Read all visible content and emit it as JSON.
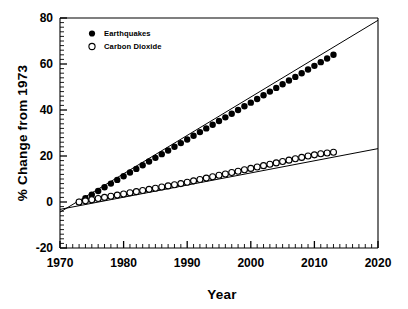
{
  "chart_data": {
    "type": "scatter",
    "title": "",
    "subtitle": "",
    "xlabel": "Year",
    "ylabel": "% Change from 1973",
    "xlim": [
      1970,
      2020
    ],
    "ylim": [
      -20,
      80
    ],
    "xticks": [
      1970,
      1980,
      1990,
      2000,
      2010,
      2020
    ],
    "xtick_labels": [
      "1970",
      "1980",
      "1990",
      "2000",
      "2010",
      "2020"
    ],
    "yticks": [
      -20,
      0,
      20,
      40,
      60,
      80
    ],
    "ytick_labels": [
      "-20",
      "0",
      "20",
      "40",
      "60",
      "80"
    ],
    "x_minor_tick_interval": 1,
    "y_minor_tick_interval": 2,
    "grid": false,
    "legend_position": "top-left",
    "legend": [
      {
        "name": "Earthquakes",
        "marker": "filled-circle",
        "color": "#000000"
      },
      {
        "name": "Carbon Dioxide",
        "marker": "open-circle",
        "color": "#000000"
      }
    ],
    "series": [
      {
        "name": "Earthquakes",
        "marker": "filled-circle",
        "color": "#000000",
        "x": [
          1973,
          1974,
          1975,
          1976,
          1977,
          1978,
          1979,
          1980,
          1981,
          1982,
          1983,
          1984,
          1985,
          1986,
          1987,
          1988,
          1989,
          1990,
          1991,
          1992,
          1993,
          1994,
          1995,
          1996,
          1997,
          1998,
          1999,
          2000,
          2001,
          2002,
          2003,
          2004,
          2005,
          2006,
          2007,
          2008,
          2009,
          2010,
          2011,
          2012,
          2013
        ],
        "y": [
          0.0,
          1.6,
          3.2,
          4.8,
          6.4,
          8.0,
          9.6,
          11.2,
          12.8,
          14.4,
          16.0,
          17.6,
          19.2,
          20.8,
          22.4,
          24.0,
          25.6,
          27.2,
          28.8,
          30.4,
          32.0,
          33.6,
          35.2,
          36.8,
          38.4,
          40.0,
          41.6,
          43.2,
          44.8,
          46.4,
          48.0,
          49.6,
          51.2,
          52.8,
          54.4,
          56.0,
          57.6,
          59.2,
          60.8,
          62.4,
          64.0
        ],
        "trendline": {
          "x": [
            1970,
            2020
          ],
          "y": [
            -4.4,
            79.0
          ]
        }
      },
      {
        "name": "Carbon Dioxide",
        "marker": "open-circle",
        "color": "#000000",
        "x": [
          1973,
          1974,
          1975,
          1976,
          1977,
          1978,
          1979,
          1980,
          1981,
          1982,
          1983,
          1984,
          1985,
          1986,
          1987,
          1988,
          1989,
          1990,
          1991,
          1992,
          1993,
          1994,
          1995,
          1996,
          1997,
          1998,
          1999,
          2000,
          2001,
          2002,
          2003,
          2004,
          2005,
          2006,
          2007,
          2008,
          2009,
          2010,
          2011,
          2012,
          2013
        ],
        "y": [
          0.0,
          0.5,
          1.0,
          1.5,
          2.0,
          2.5,
          3.0,
          3.5,
          4.0,
          4.5,
          5.0,
          5.5,
          6.0,
          6.5,
          7.0,
          7.5,
          8.0,
          8.6,
          9.2,
          9.8,
          10.4,
          11.0,
          11.6,
          12.2,
          12.8,
          13.4,
          14.0,
          14.6,
          15.2,
          15.8,
          16.4,
          17.0,
          17.6,
          18.2,
          18.8,
          19.4,
          20.0,
          20.5,
          21.0,
          21.3,
          21.6
        ],
        "trendline": {
          "x": [
            1970,
            2020
          ],
          "y": [
            -3.2,
            23.2
          ]
        }
      }
    ]
  },
  "axes": {
    "ylabel": "% Change from 1973",
    "xlabel": "Year"
  },
  "legend": {
    "earthquakes_label": "Earthquakes",
    "carbon_dioxide_label": "Carbon Dioxide"
  },
  "xtick_labels": {
    "t0": "1970",
    "t1": "1980",
    "t2": "1990",
    "t3": "2000",
    "t4": "2010",
    "t5": "2020"
  },
  "ytick_labels": {
    "t0": "-20",
    "t1": "0",
    "t2": "20",
    "t3": "40",
    "t4": "60",
    "t5": "80"
  }
}
